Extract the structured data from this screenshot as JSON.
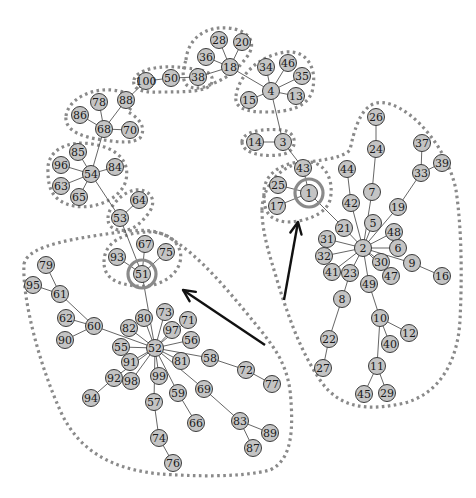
{
  "diagram": {
    "type": "network-graph",
    "colors": {
      "node_fill": "#c4c4c4",
      "node_stroke": "#3a3a3a",
      "edge": "#555555",
      "outline": "#8a8a8a",
      "arrow": "#111111"
    },
    "nodes": [
      {
        "id": "28",
        "x": 219,
        "y": 40
      },
      {
        "id": "20",
        "x": 242,
        "y": 42
      },
      {
        "id": "36",
        "x": 206,
        "y": 57
      },
      {
        "id": "18",
        "x": 230,
        "y": 67
      },
      {
        "id": "38",
        "x": 198,
        "y": 77
      },
      {
        "id": "50",
        "x": 171,
        "y": 78
      },
      {
        "id": "100",
        "x": 146,
        "y": 81
      },
      {
        "id": "34",
        "x": 266,
        "y": 67
      },
      {
        "id": "46",
        "x": 288,
        "y": 63
      },
      {
        "id": "35",
        "x": 302,
        "y": 76
      },
      {
        "id": "4",
        "x": 271,
        "y": 91
      },
      {
        "id": "13",
        "x": 296,
        "y": 96
      },
      {
        "id": "15",
        "x": 249,
        "y": 100
      },
      {
        "id": "78",
        "x": 99,
        "y": 102
      },
      {
        "id": "88",
        "x": 126,
        "y": 100
      },
      {
        "id": "86",
        "x": 80,
        "y": 115
      },
      {
        "id": "68",
        "x": 104,
        "y": 129
      },
      {
        "id": "70",
        "x": 130,
        "y": 130
      },
      {
        "id": "14",
        "x": 255,
        "y": 142
      },
      {
        "id": "3",
        "x": 283,
        "y": 142
      },
      {
        "id": "85",
        "x": 78,
        "y": 152
      },
      {
        "id": "96",
        "x": 61,
        "y": 165
      },
      {
        "id": "84",
        "x": 115,
        "y": 167
      },
      {
        "id": "54",
        "x": 91,
        "y": 174
      },
      {
        "id": "63",
        "x": 61,
        "y": 186
      },
      {
        "id": "65",
        "x": 79,
        "y": 197
      },
      {
        "id": "64",
        "x": 139,
        "y": 200
      },
      {
        "id": "53",
        "x": 120,
        "y": 218
      },
      {
        "id": "43",
        "x": 303,
        "y": 168
      },
      {
        "id": "25",
        "x": 278,
        "y": 185
      },
      {
        "id": "1",
        "x": 309,
        "y": 193
      },
      {
        "id": "17",
        "x": 277,
        "y": 206
      },
      {
        "id": "67",
        "x": 145,
        "y": 244
      },
      {
        "id": "75",
        "x": 166,
        "y": 252
      },
      {
        "id": "93",
        "x": 117,
        "y": 257
      },
      {
        "id": "51",
        "x": 142,
        "y": 274
      },
      {
        "id": "79",
        "x": 46,
        "y": 265
      },
      {
        "id": "95",
        "x": 33,
        "y": 285
      },
      {
        "id": "61",
        "x": 60,
        "y": 294
      },
      {
        "id": "62",
        "x": 66,
        "y": 318
      },
      {
        "id": "60",
        "x": 94,
        "y": 326
      },
      {
        "id": "90",
        "x": 65,
        "y": 340
      },
      {
        "id": "82",
        "x": 129,
        "y": 328
      },
      {
        "id": "80",
        "x": 144,
        "y": 318
      },
      {
        "id": "73",
        "x": 165,
        "y": 312
      },
      {
        "id": "71",
        "x": 188,
        "y": 320
      },
      {
        "id": "97",
        "x": 172,
        "y": 330
      },
      {
        "id": "56",
        "x": 191,
        "y": 340
      },
      {
        "id": "55",
        "x": 121,
        "y": 347
      },
      {
        "id": "52",
        "x": 155,
        "y": 348
      },
      {
        "id": "91",
        "x": 130,
        "y": 362
      },
      {
        "id": "81",
        "x": 181,
        "y": 361
      },
      {
        "id": "58",
        "x": 210,
        "y": 358
      },
      {
        "id": "98",
        "x": 131,
        "y": 381
      },
      {
        "id": "99",
        "x": 159,
        "y": 376
      },
      {
        "id": "92",
        "x": 114,
        "y": 378
      },
      {
        "id": "69",
        "x": 204,
        "y": 389
      },
      {
        "id": "59",
        "x": 178,
        "y": 393
      },
      {
        "id": "72",
        "x": 246,
        "y": 370
      },
      {
        "id": "77",
        "x": 272,
        "y": 384
      },
      {
        "id": "57",
        "x": 154,
        "y": 402
      },
      {
        "id": "94",
        "x": 91,
        "y": 398
      },
      {
        "id": "66",
        "x": 196,
        "y": 423
      },
      {
        "id": "83",
        "x": 240,
        "y": 421
      },
      {
        "id": "89",
        "x": 270,
        "y": 433
      },
      {
        "id": "87",
        "x": 253,
        "y": 448
      },
      {
        "id": "74",
        "x": 159,
        "y": 438
      },
      {
        "id": "76",
        "x": 173,
        "y": 463
      },
      {
        "id": "26",
        "x": 376,
        "y": 117
      },
      {
        "id": "24",
        "x": 376,
        "y": 149
      },
      {
        "id": "37",
        "x": 422,
        "y": 143
      },
      {
        "id": "39",
        "x": 442,
        "y": 163
      },
      {
        "id": "33",
        "x": 421,
        "y": 173
      },
      {
        "id": "44",
        "x": 347,
        "y": 169
      },
      {
        "id": "7",
        "x": 372,
        "y": 192
      },
      {
        "id": "42",
        "x": 351,
        "y": 203
      },
      {
        "id": "19",
        "x": 398,
        "y": 207
      },
      {
        "id": "5",
        "x": 373,
        "y": 223
      },
      {
        "id": "21",
        "x": 344,
        "y": 228
      },
      {
        "id": "48",
        "x": 394,
        "y": 232
      },
      {
        "id": "31",
        "x": 327,
        "y": 239
      },
      {
        "id": "6",
        "x": 398,
        "y": 248
      },
      {
        "id": "2",
        "x": 363,
        "y": 248
      },
      {
        "id": "32",
        "x": 324,
        "y": 256
      },
      {
        "id": "30",
        "x": 381,
        "y": 262
      },
      {
        "id": "9",
        "x": 412,
        "y": 263
      },
      {
        "id": "41",
        "x": 332,
        "y": 272
      },
      {
        "id": "23",
        "x": 350,
        "y": 273
      },
      {
        "id": "47",
        "x": 391,
        "y": 276
      },
      {
        "id": "16",
        "x": 442,
        "y": 276
      },
      {
        "id": "49",
        "x": 369,
        "y": 284
      },
      {
        "id": "8",
        "x": 342,
        "y": 299
      },
      {
        "id": "10",
        "x": 380,
        "y": 318
      },
      {
        "id": "12",
        "x": 409,
        "y": 333
      },
      {
        "id": "40",
        "x": 390,
        "y": 344
      },
      {
        "id": "22",
        "x": 329,
        "y": 339
      },
      {
        "id": "11",
        "x": 377,
        "y": 366
      },
      {
        "id": "27",
        "x": 323,
        "y": 368
      },
      {
        "id": "45",
        "x": 364,
        "y": 394
      },
      {
        "id": "29",
        "x": 387,
        "y": 393
      }
    ],
    "edges": [
      [
        "28",
        "18"
      ],
      [
        "20",
        "18"
      ],
      [
        "36",
        "18"
      ],
      [
        "38",
        "18"
      ],
      [
        "38",
        "50"
      ],
      [
        "50",
        "100"
      ],
      [
        "100",
        "88"
      ],
      [
        "18",
        "4"
      ],
      [
        "34",
        "4"
      ],
      [
        "46",
        "4"
      ],
      [
        "35",
        "4"
      ],
      [
        "13",
        "4"
      ],
      [
        "15",
        "4"
      ],
      [
        "4",
        "3"
      ],
      [
        "14",
        "3"
      ],
      [
        "3",
        "43"
      ],
      [
        "43",
        "1"
      ],
      [
        "25",
        "1"
      ],
      [
        "17",
        "1"
      ],
      [
        "1",
        "21"
      ],
      [
        "78",
        "68"
      ],
      [
        "88",
        "68"
      ],
      [
        "86",
        "68"
      ],
      [
        "70",
        "68"
      ],
      [
        "68",
        "54"
      ],
      [
        "85",
        "54"
      ],
      [
        "96",
        "54"
      ],
      [
        "84",
        "54"
      ],
      [
        "63",
        "54"
      ],
      [
        "65",
        "54"
      ],
      [
        "54",
        "53"
      ],
      [
        "64",
        "53"
      ],
      [
        "53",
        "51"
      ],
      [
        "67",
        "51"
      ],
      [
        "75",
        "51"
      ],
      [
        "93",
        "51"
      ],
      [
        "51",
        "52"
      ],
      [
        "79",
        "61"
      ],
      [
        "95",
        "61"
      ],
      [
        "61",
        "60"
      ],
      [
        "62",
        "60"
      ],
      [
        "90",
        "60"
      ],
      [
        "60",
        "52"
      ],
      [
        "82",
        "52"
      ],
      [
        "80",
        "52"
      ],
      [
        "73",
        "52"
      ],
      [
        "71",
        "52"
      ],
      [
        "97",
        "52"
      ],
      [
        "56",
        "52"
      ],
      [
        "55",
        "52"
      ],
      [
        "91",
        "52"
      ],
      [
        "81",
        "52"
      ],
      [
        "58",
        "52"
      ],
      [
        "98",
        "52"
      ],
      [
        "99",
        "52"
      ],
      [
        "92",
        "52"
      ],
      [
        "69",
        "52"
      ],
      [
        "59",
        "52"
      ],
      [
        "57",
        "52"
      ],
      [
        "58",
        "72"
      ],
      [
        "72",
        "77"
      ],
      [
        "92",
        "94"
      ],
      [
        "59",
        "66"
      ],
      [
        "69",
        "83"
      ],
      [
        "83",
        "89"
      ],
      [
        "83",
        "87"
      ],
      [
        "57",
        "74"
      ],
      [
        "74",
        "76"
      ],
      [
        "26",
        "24"
      ],
      [
        "24",
        "7"
      ],
      [
        "7",
        "2"
      ],
      [
        "37",
        "33"
      ],
      [
        "39",
        "33"
      ],
      [
        "33",
        "19"
      ],
      [
        "19",
        "2"
      ],
      [
        "44",
        "42"
      ],
      [
        "42",
        "2"
      ],
      [
        "5",
        "2"
      ],
      [
        "21",
        "2"
      ],
      [
        "48",
        "2"
      ],
      [
        "31",
        "2"
      ],
      [
        "6",
        "2"
      ],
      [
        "32",
        "2"
      ],
      [
        "30",
        "2"
      ],
      [
        "9",
        "2"
      ],
      [
        "41",
        "2"
      ],
      [
        "23",
        "2"
      ],
      [
        "47",
        "2"
      ],
      [
        "49",
        "2"
      ],
      [
        "9",
        "16"
      ],
      [
        "23",
        "8"
      ],
      [
        "8",
        "22"
      ],
      [
        "22",
        "27"
      ],
      [
        "49",
        "10"
      ],
      [
        "10",
        "12"
      ],
      [
        "10",
        "40"
      ],
      [
        "10",
        "11"
      ],
      [
        "11",
        "45"
      ],
      [
        "11",
        "29"
      ]
    ],
    "highlighted_nodes": [
      "1",
      "51"
    ],
    "group_outlines": [
      {
        "name": "group-18",
        "path": "M 186 60 C 188 38 206 26 228 28 C 250 30 258 44 246 58 C 240 66 232 76 212 84 C 200 90 186 90 184 80 C 182 72 184 66 186 60 Z"
      },
      {
        "name": "group-38-50-100",
        "path": "M 134 80 C 136 70 160 64 186 68 C 204 70 214 72 212 82 C 210 92 186 92 160 92 C 140 93 132 88 134 80 Z"
      },
      {
        "name": "group-4",
        "path": "M 236 96 C 238 78 256 56 286 52 C 308 50 318 70 312 92 C 306 108 288 112 266 112 C 246 112 234 108 236 96 Z"
      },
      {
        "name": "group-68",
        "path": "M 66 116 C 68 100 90 88 112 90 C 132 92 138 100 128 112 C 136 116 148 126 140 138 C 132 144 118 142 104 140 C 86 138 64 132 66 116 Z"
      },
      {
        "name": "group-14-3",
        "path": "M 242 142 C 242 132 262 128 282 130 C 298 132 298 150 284 154 C 266 158 242 154 242 142 Z"
      },
      {
        "name": "group-54",
        "path": "M 48 172 C 46 150 68 140 92 144 C 118 148 130 162 126 180 C 122 198 96 210 74 206 C 54 202 48 190 48 172 Z"
      },
      {
        "name": "group-64-53",
        "path": "M 108 218 C 108 206 126 188 140 190 C 154 192 156 204 148 214 C 140 224 132 232 118 230 C 110 228 108 224 108 218 Z"
      },
      {
        "name": "group-51",
        "path": "M 104 262 C 104 242 124 232 150 232 C 172 232 184 248 180 262 C 176 278 156 288 136 286 C 116 284 104 278 104 262 Z"
      },
      {
        "name": "group-1",
        "path": "M 264 196 C 262 172 286 160 310 162 C 328 164 334 184 330 200 C 326 214 306 222 286 222 C 268 220 264 210 264 196 Z"
      },
      {
        "name": "region-left",
        "path": "M 24 264 C 28 244 80 238 120 232 C 150 228 160 232 170 238 C 200 256 228 290 262 332 C 276 350 286 364 290 390 C 294 430 292 460 270 470 C 240 478 190 476 160 474 C 120 470 80 456 60 410 C 40 366 22 300 24 264 Z"
      },
      {
        "name": "region-right",
        "path": "M 262 210 C 262 190 276 170 296 164 C 316 160 340 160 350 150 C 358 110 370 98 390 104 C 416 112 448 150 456 190 C 462 230 462 280 460 320 C 458 360 440 396 400 404 C 370 410 340 410 320 380 C 300 350 290 320 280 290 C 272 262 262 236 262 210 Z"
      }
    ],
    "arrows": [
      {
        "name": "arrow-to-51",
        "from": [
          265,
          345
        ],
        "to": [
          183,
          290
        ]
      },
      {
        "name": "arrow-to-1",
        "from": [
          284,
          300
        ],
        "to": [
          298,
          222
        ]
      }
    ]
  }
}
